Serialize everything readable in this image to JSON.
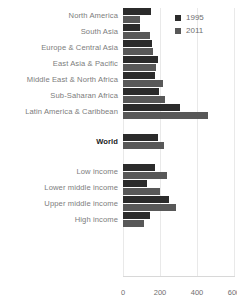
{
  "chart_data": {
    "type": "bar",
    "orientation": "horizontal",
    "title": "",
    "xlabel": "",
    "ylabel": "",
    "xlim": [
      0,
      600
    ],
    "xticks": [
      0,
      200,
      400,
      600
    ],
    "grid": true,
    "legend_position": "top-right",
    "categories": [
      "North America",
      "South Asia",
      "Europe & Central Asia",
      "East Asia & Pacific",
      "Middle East & North Africa",
      "Sub-Saharan Africa",
      "Latin America & Caribbean",
      "World",
      "Low income",
      "Lower middle income",
      "Upper middle income",
      "High income"
    ],
    "series": [
      {
        "name": "1995",
        "color": "#2b2b2b",
        "values": [
          152,
          92,
          158,
          188,
          172,
          195,
          308,
          190,
          175,
          132,
          250,
          145
        ]
      },
      {
        "name": "2011",
        "color": "#585858",
        "values": [
          92,
          148,
          160,
          178,
          218,
          228,
          462,
          222,
          240,
          200,
          285,
          115
        ]
      }
    ],
    "groups": [
      {
        "name": "regions",
        "categories": [
          0,
          1,
          2,
          3,
          4,
          5,
          6
        ]
      },
      {
        "name": "world",
        "categories": [
          7
        ]
      },
      {
        "name": "income",
        "categories": [
          8,
          9,
          10,
          11
        ]
      }
    ],
    "emphasized_categories": [
      "World"
    ]
  },
  "legend": {
    "items": [
      {
        "label": "1995",
        "color": "#2b2b2b"
      },
      {
        "label": "2011",
        "color": "#585858"
      }
    ]
  }
}
